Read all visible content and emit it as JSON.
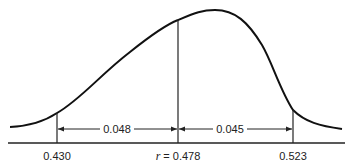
{
  "diagram": {
    "type": "distribution-curve",
    "markers": [
      {
        "id": "lower",
        "label": "0.430",
        "value": 0.43
      },
      {
        "id": "center",
        "label_var": "r",
        "label_eq": " = 0.478",
        "value": 0.478
      },
      {
        "id": "upper",
        "label": "0.523",
        "value": 0.523
      }
    ],
    "intervals": [
      {
        "id": "left",
        "label": "0.048"
      },
      {
        "id": "right",
        "label": "0.045"
      }
    ]
  }
}
